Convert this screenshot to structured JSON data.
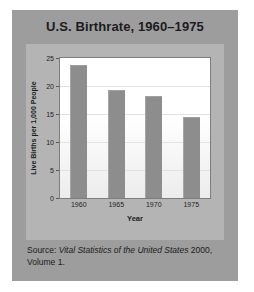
{
  "chart_data": {
    "type": "bar",
    "title": "U.S. Birthrate, 1960–1975",
    "xlabel": "Year",
    "ylabel": "Live Births per 1,000 People",
    "categories": [
      "1960",
      "1965",
      "1970",
      "1975"
    ],
    "values": [
      23.7,
      19.3,
      18.3,
      14.5
    ],
    "ylim": [
      0,
      25
    ],
    "yticks": [
      0,
      5,
      10,
      15,
      20,
      25
    ],
    "ytick_labels": [
      "0",
      "5",
      "10",
      "15",
      "20",
      "25"
    ],
    "grid": true,
    "legend": false,
    "bar_color": "#8d8d8d",
    "plot_bg": "#ffffff",
    "panel_bg": "#b4b4b4",
    "card_bg": "#9d9d9d",
    "text_color": "#1c1c1c"
  },
  "source": {
    "prefix": "Source: ",
    "italic_title": "Vital Statistics of the United States",
    "suffix": " 2000, Volume 1."
  }
}
